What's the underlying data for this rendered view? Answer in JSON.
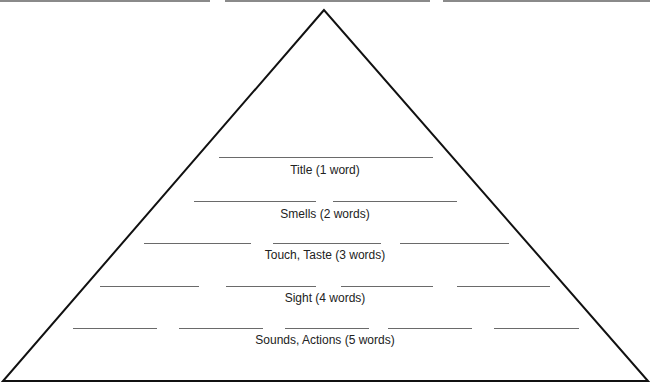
{
  "header_blanks": [
    {
      "x": 0,
      "w": 210
    },
    {
      "x": 225,
      "w": 205
    },
    {
      "x": 443,
      "w": 207
    }
  ],
  "pyramid": {
    "apex": [
      324,
      10
    ],
    "base_left": [
      3,
      381
    ],
    "base_right": [
      648,
      381
    ]
  },
  "levels": [
    {
      "label": "Title (1 word)",
      "label_y": 163,
      "line_y": 157,
      "blanks": [
        {
          "x": 219,
          "w": 214
        }
      ]
    },
    {
      "label": "Smells (2 words)",
      "label_y": 207,
      "line_y": 201,
      "blanks": [
        {
          "x": 194,
          "w": 122
        },
        {
          "x": 333,
          "w": 124
        }
      ]
    },
    {
      "label": "Touch, Taste (3 words)",
      "label_y": 248,
      "line_y": 243,
      "blanks": [
        {
          "x": 144,
          "w": 107
        },
        {
          "x": 273,
          "w": 108
        },
        {
          "x": 400,
          "w": 109
        }
      ]
    },
    {
      "label": "Sight (4 words)",
      "label_y": 291,
      "line_y": 286,
      "blanks": [
        {
          "x": 100,
          "w": 99
        },
        {
          "x": 226,
          "w": 90
        },
        {
          "x": 341,
          "w": 92
        },
        {
          "x": 457,
          "w": 93
        }
      ]
    },
    {
      "label": "Sounds, Actions (5 words)",
      "label_y": 333,
      "line_y": 328,
      "blanks": [
        {
          "x": 73,
          "w": 84
        },
        {
          "x": 179,
          "w": 84
        },
        {
          "x": 285,
          "w": 84
        },
        {
          "x": 388,
          "w": 84
        },
        {
          "x": 494,
          "w": 85
        }
      ]
    }
  ]
}
